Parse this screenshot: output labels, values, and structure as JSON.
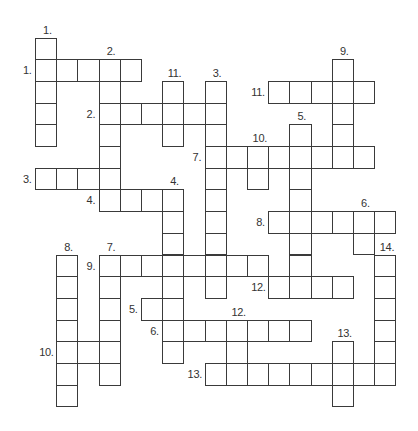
{
  "puzzle": {
    "type": "crossword",
    "grid": {
      "cols": 17,
      "rows": 17,
      "origin_x": 35,
      "origin_y": 37.5,
      "cell_w": 21.2,
      "cell_h": 21.7
    },
    "colors": {
      "line": "#3a3a3a",
      "label": "#333333",
      "background": "#ffffff"
    },
    "across": [
      {
        "number": "1.",
        "row": 1,
        "col": 0,
        "length": 5
      },
      {
        "number": "2.",
        "row": 3,
        "col": 3,
        "length": 6
      },
      {
        "number": "11.",
        "row": 2,
        "col": 11,
        "length": 5
      },
      {
        "number": "7.",
        "row": 5,
        "col": 8,
        "length": 8
      },
      {
        "number": "3.",
        "row": 6,
        "col": 0,
        "length": 4
      },
      {
        "number": "4.",
        "row": 7,
        "col": 3,
        "length": 4
      },
      {
        "number": "8.",
        "row": 8,
        "col": 11,
        "length": 6
      },
      {
        "number": "9.",
        "row": 10,
        "col": 3,
        "length": 8
      },
      {
        "number": "12.",
        "row": 11,
        "col": 11,
        "length": 4
      },
      {
        "number": "5.",
        "row": 12,
        "col": 5,
        "length": 2
      },
      {
        "number": "6.",
        "row": 13,
        "col": 6,
        "length": 7
      },
      {
        "number": "10.",
        "row": 14,
        "col": 1,
        "length": 3
      },
      {
        "number": "13.",
        "row": 15,
        "col": 8,
        "length": 9
      }
    ],
    "down": [
      {
        "number": "1.",
        "row": 0,
        "col": 0,
        "length": 5
      },
      {
        "number": "2.",
        "row": 1,
        "col": 3,
        "length": 7
      },
      {
        "number": "11.",
        "row": 2,
        "col": 6,
        "length": 3
      },
      {
        "number": "3.",
        "row": 2,
        "col": 8,
        "length": 10
      },
      {
        "number": "9.",
        "row": 1,
        "col": 14,
        "length": 5
      },
      {
        "number": "5.",
        "row": 4,
        "col": 12,
        "length": 8
      },
      {
        "number": "10.",
        "row": 5,
        "col": 10,
        "length": 2
      },
      {
        "number": "4.",
        "row": 7,
        "col": 6,
        "length": 8
      },
      {
        "number": "6.",
        "row": 8,
        "col": 15,
        "length": 2
      },
      {
        "number": "8.",
        "row": 10,
        "col": 1,
        "length": 7
      },
      {
        "number": "7.",
        "row": 10,
        "col": 3,
        "length": 6
      },
      {
        "number": "14.",
        "row": 10,
        "col": 16,
        "length": 6
      },
      {
        "number": "12.",
        "row": 13,
        "col": 9,
        "length": 3
      },
      {
        "number": "13.",
        "row": 14,
        "col": 14,
        "length": 3
      }
    ]
  }
}
